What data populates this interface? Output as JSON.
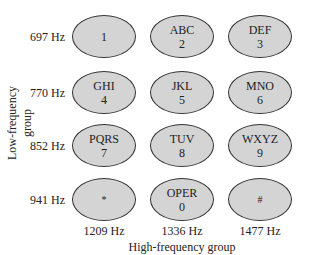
{
  "diagram": {
    "y_axis_label": "Low-frequency group",
    "x_axis_label": "High-frequency group",
    "row_labels": [
      "697 Hz",
      "770 Hz",
      "852 Hz",
      "941 Hz"
    ],
    "column_labels": [
      "1209 Hz",
      "1336 Hz",
      "1477 Hz"
    ],
    "keys": [
      [
        {
          "letters": "",
          "digit": "1"
        },
        {
          "letters": "ABC",
          "digit": "2"
        },
        {
          "letters": "DEF",
          "digit": "3"
        }
      ],
      [
        {
          "letters": "GHI",
          "digit": "4"
        },
        {
          "letters": "JKL",
          "digit": "5"
        },
        {
          "letters": "MNO",
          "digit": "6"
        }
      ],
      [
        {
          "letters": "PQRS",
          "digit": "7"
        },
        {
          "letters": "TUV",
          "digit": "8"
        },
        {
          "letters": "WXYZ",
          "digit": "9"
        }
      ],
      [
        {
          "letters": "",
          "digit": "*"
        },
        {
          "letters": "OPER",
          "digit": "0"
        },
        {
          "letters": "",
          "digit": "#"
        }
      ]
    ],
    "colors": {
      "key_fill": "#d4d4d4",
      "key_border": "#333333"
    }
  }
}
